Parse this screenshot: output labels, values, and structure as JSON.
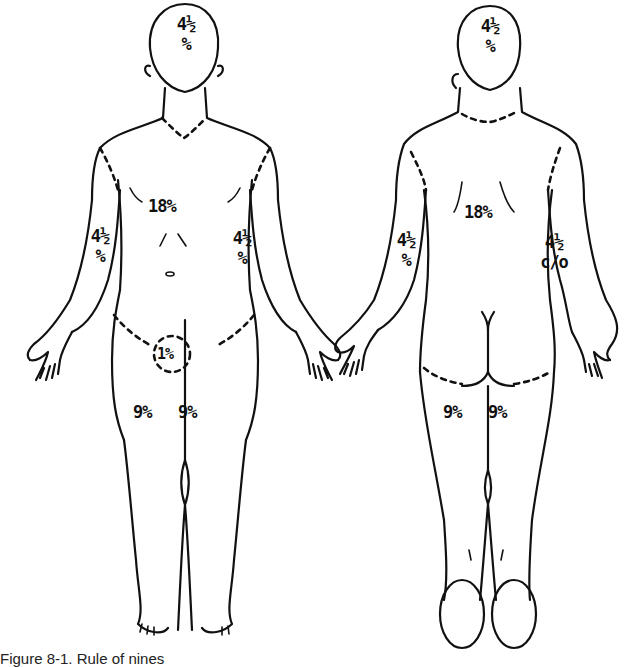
{
  "figure": {
    "caption": "Figure 8-1. Rule of nines",
    "views": [
      {
        "name": "anterior",
        "labels": {
          "head": {
            "value": "4½",
            "unit": "%"
          },
          "trunk": "18%",
          "right_arm": {
            "value": "4½",
            "unit": "%"
          },
          "left_arm": {
            "value": "4½",
            "unit": "%"
          },
          "perineum": "1%",
          "right_leg": "9%",
          "left_leg": "9%"
        }
      },
      {
        "name": "posterior",
        "labels": {
          "head": {
            "value": "4½",
            "unit": "%"
          },
          "trunk": "18%",
          "left_arm": {
            "value": "4½",
            "unit": "%"
          },
          "right_arm": {
            "value": "4½",
            "unit": "c/o"
          },
          "left_leg": "9%",
          "right_leg": "9%"
        }
      }
    ]
  }
}
